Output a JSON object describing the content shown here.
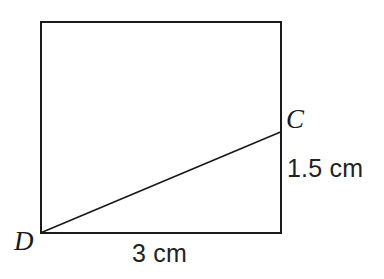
{
  "figure": {
    "type": "geometry-diagram",
    "background_color": "#ffffff",
    "stroke_color": "#1a1a1a",
    "rectangle": {
      "name": "rectangle-outline",
      "x": 41,
      "y": 22,
      "width": 240,
      "height": 211,
      "stroke_width": 2.4
    },
    "diagonal": {
      "name": "segment-DC",
      "from": {
        "label": "D",
        "x": 41,
        "y": 233
      },
      "to": {
        "label": "C",
        "x": 281,
        "y": 132
      },
      "stroke_width": 1.6
    },
    "vertices": [
      {
        "id": "D",
        "label": "D",
        "x": 41,
        "y": 233
      },
      {
        "id": "C",
        "label": "C",
        "x": 281,
        "y": 132
      }
    ],
    "measurements": [
      {
        "id": "height",
        "label": "1.5 cm",
        "value": 1.5,
        "unit": "cm",
        "describes": "vertical distance from C down to the bottom-right corner"
      },
      {
        "id": "width",
        "label": "3 cm",
        "value": 3,
        "unit": "cm",
        "describes": "horizontal length of the bottom edge from D to the bottom-right corner"
      }
    ]
  }
}
